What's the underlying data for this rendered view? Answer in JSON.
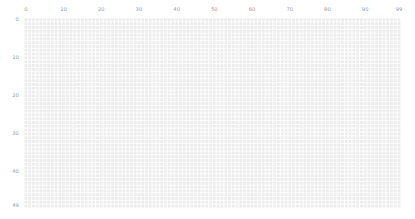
{
  "figure": {
    "background_color": "#ffffff",
    "cell_color": "#ececec",
    "gap_color": "#ffffff",
    "tick_text_color": "#9a9a9a"
  },
  "plot": {
    "left": 24,
    "top": 18,
    "width": 377,
    "height": 190
  },
  "chart_data": {
    "type": "heatmap",
    "title": "",
    "xlabel": "",
    "ylabel": "",
    "grid": true,
    "legend": "none",
    "colorbar": false,
    "n_cols": 100,
    "n_rows": 50,
    "xlim": [
      0,
      99
    ],
    "ylim": [
      0,
      49
    ],
    "x_axis_position": "top",
    "y_axis_position": "left",
    "xticks": [
      0,
      10,
      20,
      30,
      40,
      50,
      60,
      70,
      80,
      90,
      99
    ],
    "xticklabels": [
      "0",
      "10",
      "20",
      "30",
      "40",
      "50",
      "60",
      "70",
      "80",
      "90",
      "99"
    ],
    "yticks": [
      0,
      10,
      20,
      30,
      40,
      49
    ],
    "yticklabels": [
      "0",
      "10",
      "20",
      "30",
      "40",
      "49"
    ],
    "uniform_value": 1,
    "value_range": [
      1,
      1
    ],
    "colormap": "uniform-light-gray"
  }
}
